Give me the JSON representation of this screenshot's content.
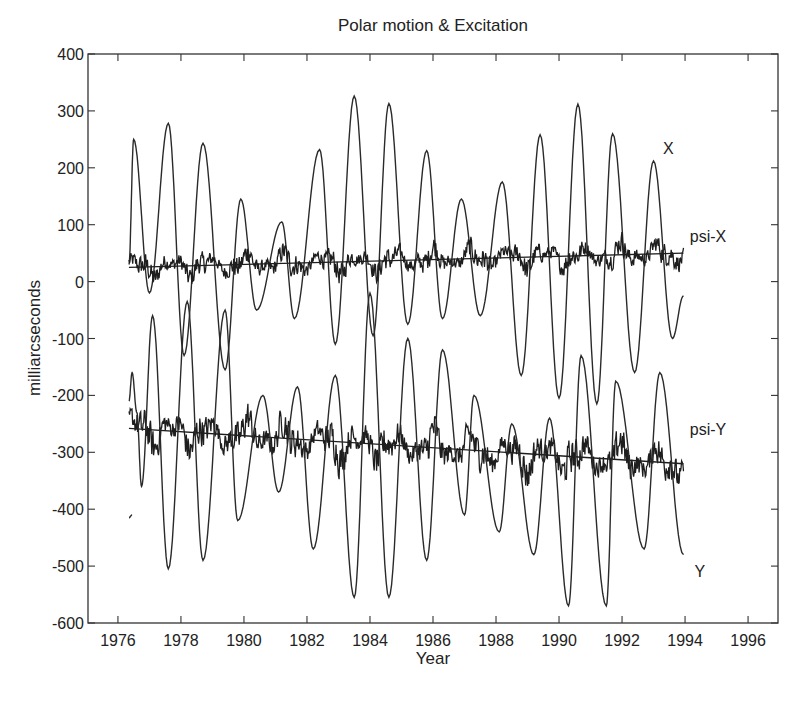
{
  "chart_data": {
    "type": "line",
    "title": "Polar motion & Excitation",
    "xlabel": "Year",
    "ylabel": "milliarcseconds",
    "xlim": [
      1975.05,
      1996.95
    ],
    "ylim": [
      -600,
      400
    ],
    "xticks": [
      1976,
      1978,
      1980,
      1982,
      1984,
      1986,
      1988,
      1990,
      1992,
      1994,
      1996
    ],
    "yticks": [
      400,
      300,
      200,
      100,
      0,
      -100,
      -200,
      -300,
      -400,
      -500,
      -600
    ],
    "grid": false,
    "legend": "inline labels at right end of each series",
    "series": [
      {
        "name": "X",
        "label_pos": [
          1993.3,
          225
        ],
        "style": "smooth",
        "points": [
          [
            1976.35,
            30
          ],
          [
            1976.5,
            250
          ],
          [
            1977.0,
            -20
          ],
          [
            1977.6,
            278
          ],
          [
            1978.1,
            -130
          ],
          [
            1978.7,
            243
          ],
          [
            1979.4,
            -155
          ],
          [
            1979.9,
            145
          ],
          [
            1980.4,
            -50
          ],
          [
            1981.2,
            105
          ],
          [
            1981.6,
            -65
          ],
          [
            1982.4,
            232
          ],
          [
            1982.9,
            -110
          ],
          [
            1983.5,
            326
          ],
          [
            1984.1,
            -95
          ],
          [
            1984.6,
            313
          ],
          [
            1985.2,
            -75
          ],
          [
            1985.8,
            230
          ],
          [
            1986.3,
            -65
          ],
          [
            1986.9,
            145
          ],
          [
            1987.5,
            -60
          ],
          [
            1988.2,
            175
          ],
          [
            1988.8,
            -165
          ],
          [
            1989.4,
            258
          ],
          [
            1990.0,
            -205
          ],
          [
            1990.6,
            312
          ],
          [
            1991.2,
            -215
          ],
          [
            1991.7,
            260
          ],
          [
            1992.4,
            -160
          ],
          [
            1993.0,
            212
          ],
          [
            1993.6,
            -100
          ],
          [
            1993.95,
            -25
          ]
        ]
      },
      {
        "name": "psi-X",
        "label_pos": [
          1994.15,
          70
        ],
        "style": "noisy",
        "start": 1976.35,
        "end": 1993.95,
        "trend": [
          [
            1976.35,
            25
          ],
          [
            1993.95,
            50
          ]
        ],
        "noise_amplitude": 30
      },
      {
        "name": "psi-Y",
        "label_pos": [
          1994.15,
          -270
        ],
        "style": "noisy",
        "start": 1976.35,
        "end": 1993.95,
        "trend": [
          [
            1976.35,
            -258
          ],
          [
            1993.95,
            -320
          ]
        ],
        "noise_amplitude": 45
      },
      {
        "name": "Y",
        "label_pos": [
          1994.3,
          -520
        ],
        "style": "smooth",
        "points": [
          [
            1976.35,
            -210
          ],
          [
            1976.45,
            -160
          ],
          [
            1976.6,
            -230
          ],
          [
            1976.75,
            -360
          ],
          [
            1977.1,
            -60
          ],
          [
            1977.6,
            -505
          ],
          [
            1978.2,
            -35
          ],
          [
            1978.7,
            -490
          ],
          [
            1979.4,
            -50
          ],
          [
            1979.8,
            -420
          ],
          [
            1980.6,
            -200
          ],
          [
            1981.1,
            -370
          ],
          [
            1981.7,
            -185
          ],
          [
            1982.2,
            -470
          ],
          [
            1982.9,
            -165
          ],
          [
            1983.5,
            -555
          ],
          [
            1984.0,
            -20
          ],
          [
            1984.6,
            -555
          ],
          [
            1985.2,
            -100
          ],
          [
            1985.8,
            -490
          ],
          [
            1986.3,
            -120
          ],
          [
            1987.0,
            -410
          ],
          [
            1987.3,
            -200
          ],
          [
            1988.1,
            -440
          ],
          [
            1988.5,
            -250
          ],
          [
            1989.2,
            -480
          ],
          [
            1989.7,
            -240
          ],
          [
            1990.3,
            -570
          ],
          [
            1990.7,
            -130
          ],
          [
            1991.5,
            -570
          ],
          [
            1991.8,
            -175
          ],
          [
            1992.7,
            -470
          ],
          [
            1993.2,
            -160
          ],
          [
            1993.95,
            -480
          ]
        ]
      },
      {
        "name": "Y-start-branch",
        "style": "smooth",
        "points": [
          [
            1976.35,
            -415
          ],
          [
            1976.45,
            -410
          ]
        ]
      }
    ]
  }
}
